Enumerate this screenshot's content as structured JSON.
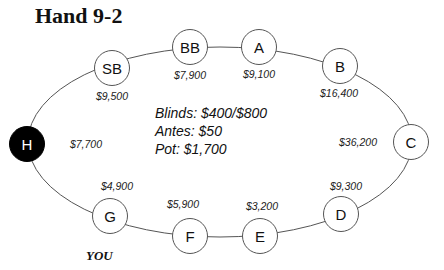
{
  "title": "Hand 9-2",
  "info": {
    "blinds": "Blinds: $400/$800",
    "antes": "Antes: $50",
    "pot": "Pot: $1,700"
  },
  "you_label": "YOU",
  "seats": [
    {
      "label": "SB",
      "stack": "$9,500"
    },
    {
      "label": "BB",
      "stack": "$7,900"
    },
    {
      "label": "A",
      "stack": "$9,100"
    },
    {
      "label": "B",
      "stack": "$16,400"
    },
    {
      "label": "C",
      "stack": "$36,200"
    },
    {
      "label": "D",
      "stack": "$9,300"
    },
    {
      "label": "E",
      "stack": "$3,200"
    },
    {
      "label": "F",
      "stack": "$5,900"
    },
    {
      "label": "G",
      "stack": "$4,900"
    },
    {
      "label": "H",
      "stack": "$7,700"
    }
  ],
  "colors": {
    "hero_seat": "#000000",
    "seat_fill": "#ffffff",
    "line": "#555555"
  }
}
